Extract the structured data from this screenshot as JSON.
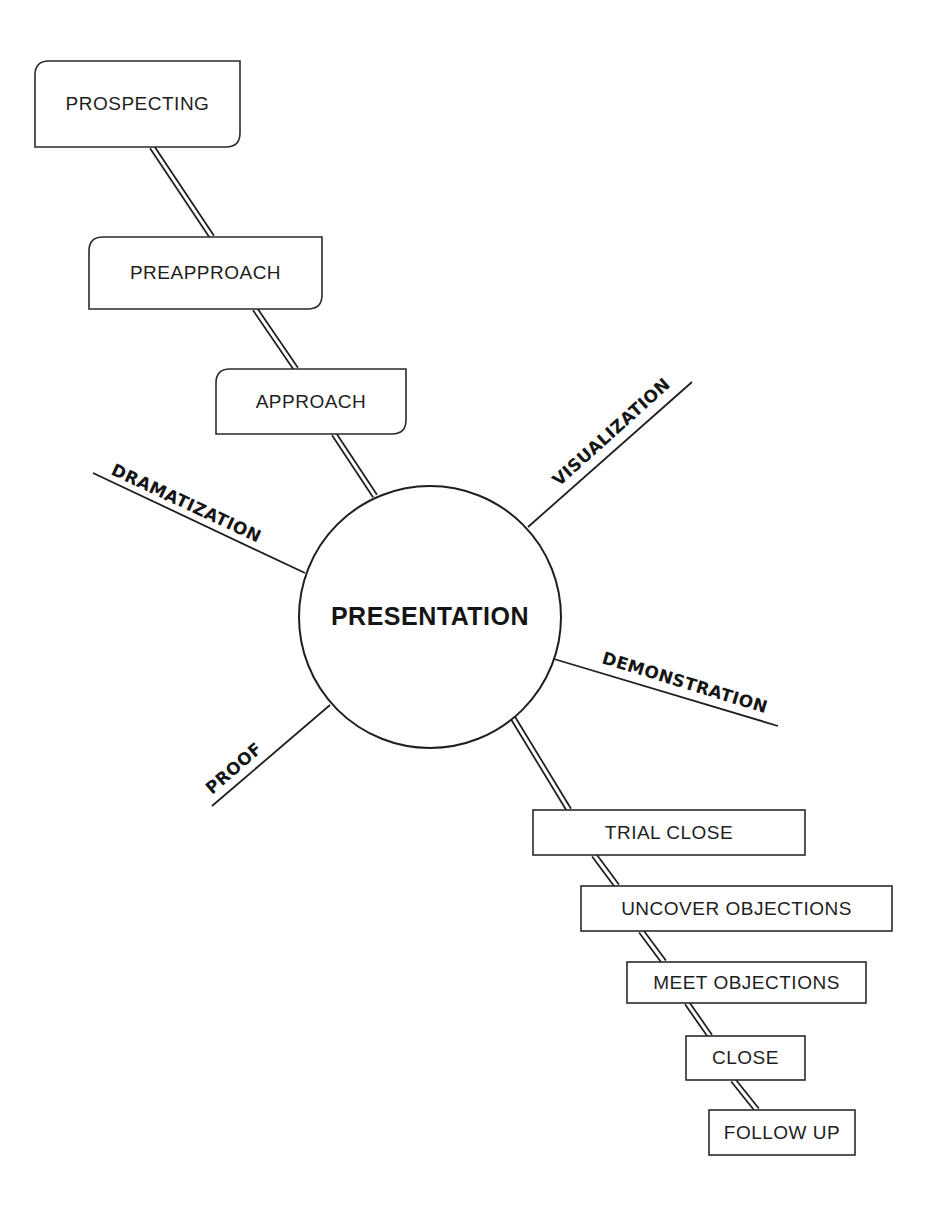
{
  "diagram": {
    "center": {
      "label": "PRESENTATION",
      "cx": 430,
      "cy": 617,
      "rx": 131,
      "ry": 131
    },
    "pre_steps": [
      {
        "label": "PROSPECTING",
        "x": 35,
        "y": 61,
        "w": 205,
        "h": 86
      },
      {
        "label": "PREAPPROACH",
        "x": 89,
        "y": 237,
        "w": 233,
        "h": 72
      },
      {
        "label": "APPROACH",
        "x": 216,
        "y": 369,
        "w": 190,
        "h": 65
      }
    ],
    "post_steps": [
      {
        "label": "TRIAL CLOSE",
        "x": 533,
        "y": 810,
        "w": 272,
        "h": 45
      },
      {
        "label": "UNCOVER OBJECTIONS",
        "x": 581,
        "y": 886,
        "w": 311,
        "h": 45
      },
      {
        "label": "MEET OBJECTIONS",
        "x": 627,
        "y": 962,
        "w": 239,
        "h": 41
      },
      {
        "label": "CLOSE",
        "x": 686,
        "y": 1036,
        "w": 119,
        "h": 44
      },
      {
        "label": "FOLLOW UP",
        "x": 709,
        "y": 1110,
        "w": 146,
        "h": 45
      }
    ],
    "connectors": [
      {
        "from": "PROSPECTING",
        "to": "PREAPPROACH",
        "x1": 152,
        "y1": 147,
        "x2": 212,
        "y2": 237
      },
      {
        "from": "PREAPPROACH",
        "to": "APPROACH",
        "x1": 255,
        "y1": 309,
        "x2": 296,
        "y2": 369
      },
      {
        "from": "APPROACH",
        "to": "PRESENTATION",
        "x1": 334,
        "y1": 434,
        "x2": 375,
        "y2": 496
      },
      {
        "from": "PRESENTATION",
        "to": "TRIAL CLOSE",
        "x1": 513,
        "y1": 718,
        "x2": 569,
        "y2": 810
      },
      {
        "from": "TRIAL CLOSE",
        "to": "UNCOVER OBJECTIONS",
        "x1": 594,
        "y1": 855,
        "x2": 617,
        "y2": 886
      },
      {
        "from": "UNCOVER OBJECTIONS",
        "to": "MEET OBJECTIONS",
        "x1": 641,
        "y1": 931,
        "x2": 664,
        "y2": 962
      },
      {
        "from": "MEET OBJECTIONS",
        "to": "CLOSE",
        "x1": 687,
        "y1": 1003,
        "x2": 710,
        "y2": 1036
      },
      {
        "from": "CLOSE",
        "to": "FOLLOW UP",
        "x1": 733,
        "y1": 1080,
        "x2": 757,
        "y2": 1110
      }
    ],
    "spokes": [
      {
        "label": "VISUALIZATION",
        "x1": 528,
        "y1": 527,
        "x2": 692,
        "y2": 382,
        "tx": 559,
        "ty": 487,
        "angle": -42
      },
      {
        "label": "DRAMATIZATION",
        "x1": 305,
        "y1": 573,
        "x2": 93,
        "y2": 473,
        "tx": 110,
        "ty": 474,
        "angle": 25
      },
      {
        "label": "DEMONSTRATION",
        "x1": 554,
        "y1": 659,
        "x2": 778,
        "y2": 726,
        "tx": 601,
        "ty": 663,
        "angle": 17
      },
      {
        "label": "PROOF",
        "x1": 330,
        "y1": 705,
        "x2": 212,
        "y2": 806,
        "tx": 212,
        "ty": 795,
        "angle": -41
      }
    ]
  }
}
